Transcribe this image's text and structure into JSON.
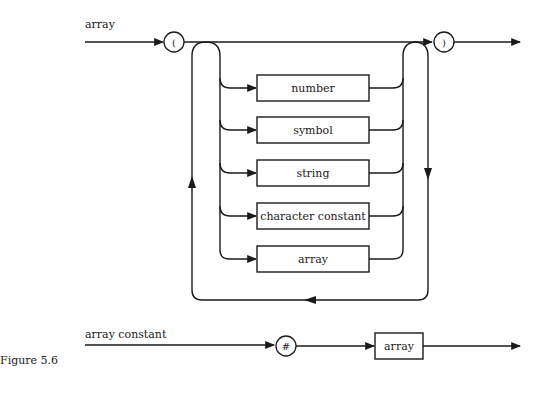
{
  "diagrams": [
    {
      "name": "array",
      "label": "array",
      "open_symbol": "(",
      "close_symbol": ")",
      "alternatives": [
        "number",
        "symbol",
        "string",
        "character constant",
        "array"
      ]
    },
    {
      "name": "array constant",
      "label": "array constant",
      "prefix_symbol": "#",
      "element": "array"
    }
  ],
  "caption": "Figure 5.6",
  "colors": {
    "ink": "#1a1a1a",
    "background": "#ffffff"
  }
}
